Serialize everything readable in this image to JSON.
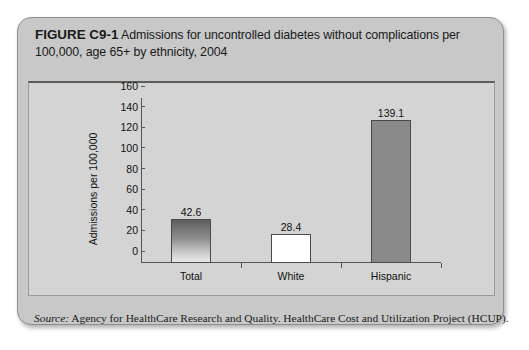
{
  "figure": {
    "label": "FIGURE C9-1",
    "title": "Admissions for uncontrolled diabetes without complications per 100,000, age 65+ by ethnicity, 2004",
    "source_label": "Source:",
    "source_text": " Agency for HealthCare Research and Quality. HealthCare Cost and Utilization Project (HCUP)."
  },
  "chart_data": {
    "type": "bar",
    "title": "Admissions for uncontrolled diabetes without complications per 100,000, age 65+ by ethnicity, 2004",
    "categories": [
      "Total",
      "White",
      "Hispanic"
    ],
    "values": [
      42.6,
      28.4,
      139.1
    ],
    "value_labels": [
      "42.6",
      "28.4",
      "139.1"
    ],
    "xlabel": "",
    "ylabel": "Admissions per 100,000",
    "ylim": [
      0,
      160
    ],
    "yticks": [
      0,
      20,
      40,
      60,
      80,
      100,
      120,
      140,
      160
    ],
    "ytick_labels": [
      "0",
      "20",
      "40",
      "60",
      "80",
      "100",
      "120",
      "140",
      "160"
    ],
    "grid": false,
    "legend": false,
    "bar_colors": [
      "gradient-dark-to-light",
      "#ffffff",
      "#8a8a8a"
    ],
    "bar_outline_color": "#4a4a4a",
    "plot_background": "#d4d4d4",
    "card_background": "#c8c8c8"
  }
}
